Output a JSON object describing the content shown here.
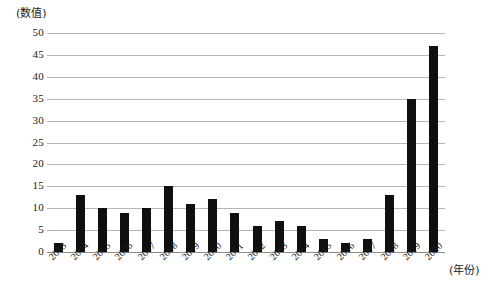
{
  "chart_data": {
    "type": "bar",
    "title": "",
    "subtitle": "",
    "xlabel": "(年份)",
    "ylabel": "(数值)",
    "categories": [
      "2003",
      "2004",
      "2005",
      "2006",
      "2007",
      "2008",
      "2009",
      "2010",
      "2011",
      "2012",
      "2013",
      "2014",
      "2015",
      "2016",
      "2017",
      "2018",
      "2019",
      "2020"
    ],
    "values": [
      2,
      13,
      10,
      9,
      10,
      15,
      11,
      12,
      9,
      6,
      7,
      6,
      3,
      2,
      3,
      13,
      35,
      47
    ],
    "series": [
      {
        "name": "",
        "values": [
          2,
          13,
          10,
          9,
          10,
          15,
          11,
          12,
          9,
          6,
          7,
          6,
          3,
          2,
          3,
          13,
          35,
          47
        ]
      }
    ],
    "ylim": [
      0,
      50
    ],
    "ytick_labels": [
      "50",
      "45",
      "40",
      "35",
      "30",
      "25",
      "20",
      "15",
      "10",
      "5",
      "0"
    ],
    "ytick_values": [
      50,
      45,
      40,
      35,
      30,
      25,
      20,
      15,
      10,
      5,
      0
    ],
    "ytick_step": 5,
    "grid": true,
    "grid_axis": "y",
    "legend": false,
    "legend_position": "none",
    "bar_color": "#100f0f",
    "grid_color": "#b6b6b6",
    "axis_color": "#8c8c8c",
    "background_color": "#ffffff",
    "xtick_rotation_deg": -45
  }
}
